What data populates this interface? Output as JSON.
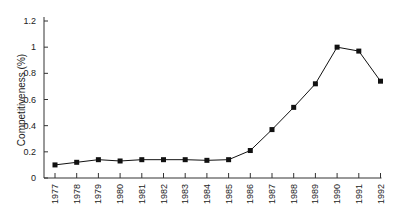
{
  "chart_data": {
    "type": "line",
    "title": "",
    "xlabel": "",
    "ylabel": "Competitiveness (%)",
    "ylim": [
      0,
      1.2
    ],
    "yticks": [
      0,
      0.2,
      0.4,
      0.6,
      0.8,
      1,
      1.2
    ],
    "ytick_labels": [
      "0",
      "0.2",
      "0.4",
      "0.6",
      "0.8",
      "1",
      "1.2"
    ],
    "grid": false,
    "legend": null,
    "categories": [
      "1977",
      "1978",
      "1979",
      "1980",
      "1981",
      "1982",
      "1983",
      "1984",
      "1985",
      "1986",
      "1987",
      "1988",
      "1989",
      "1990",
      "1991",
      "1992"
    ],
    "series": [
      {
        "name": "Competitiveness",
        "marker": "square",
        "color": "#111111",
        "values": [
          0.1,
          0.12,
          0.14,
          0.13,
          0.14,
          0.14,
          0.14,
          0.135,
          0.14,
          0.21,
          0.37,
          0.54,
          0.72,
          1.0,
          0.97,
          0.74
        ]
      }
    ]
  }
}
